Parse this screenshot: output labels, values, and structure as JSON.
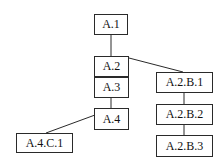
{
  "diagram": {
    "type": "tree",
    "nodes": [
      {
        "id": "A.1",
        "label": "A.1",
        "x": 94,
        "y": 14,
        "w": 34,
        "h": 21
      },
      {
        "id": "A.2",
        "label": "A.2",
        "x": 94,
        "y": 56,
        "w": 35,
        "h": 21
      },
      {
        "id": "A.3",
        "label": "A.3",
        "x": 94,
        "y": 77,
        "w": 35,
        "h": 21
      },
      {
        "id": "A.4",
        "label": "A.4",
        "x": 94,
        "y": 108,
        "w": 35,
        "h": 22
      },
      {
        "id": "A.4.C.1",
        "label": "A.4.C.1",
        "x": 16,
        "y": 133,
        "w": 57,
        "h": 20
      },
      {
        "id": "A.2.B.1",
        "label": "A.2.B.1",
        "x": 156,
        "y": 72,
        "w": 57,
        "h": 21
      },
      {
        "id": "A.2.B.2",
        "label": "A.2.B.2",
        "x": 156,
        "y": 104,
        "w": 57,
        "h": 21
      },
      {
        "id": "A.2.B.3",
        "label": "A.2.B.3",
        "x": 156,
        "y": 135,
        "w": 57,
        "h": 22
      }
    ],
    "edges": [
      {
        "from": "A.1",
        "to": "A.2"
      },
      {
        "from": "A.2",
        "to": "A.3"
      },
      {
        "from": "A.3",
        "to": "A.4"
      },
      {
        "from": "A.4",
        "to": "A.4.C.1"
      },
      {
        "from": "A.2",
        "to": "A.2.B.1"
      },
      {
        "from": "A.2.B.1",
        "to": "A.2.B.2"
      },
      {
        "from": "A.2.B.2",
        "to": "A.2.B.3"
      }
    ]
  }
}
